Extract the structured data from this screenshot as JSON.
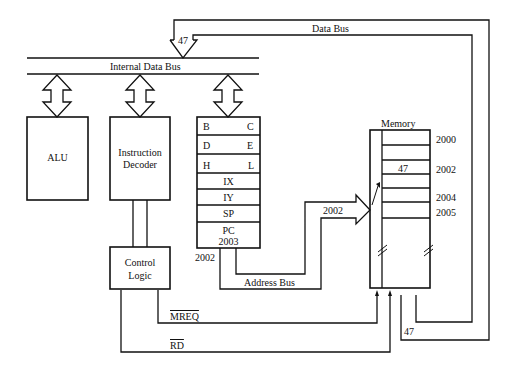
{
  "buses": {
    "data_bus": "Data Bus",
    "internal_data_bus": "Internal Data Bus",
    "address_bus": "Address Bus",
    "data_bus_value_in": "47",
    "data_bus_value_out": "47",
    "address_value": "2002",
    "address_value_out": "2002"
  },
  "blocks": {
    "alu": "ALU",
    "decoder_line1": "Instruction",
    "decoder_line2": "Decoder",
    "control_line1": "Control",
    "control_line2": "Logic"
  },
  "registers": {
    "rows": [
      {
        "left": "B",
        "right": "C"
      },
      {
        "left": "D",
        "right": "E"
      },
      {
        "left": "H",
        "right": "L"
      }
    ],
    "ix": "IX",
    "iy": "IY",
    "sp": "SP",
    "pc": "PC",
    "pc_value": "2003"
  },
  "memory": {
    "title": "Memory",
    "cell_value": "47",
    "addresses": [
      "2000",
      "2002",
      "2004",
      "2005"
    ]
  },
  "signals": {
    "mreq": "MREQ",
    "rd": "RD"
  }
}
